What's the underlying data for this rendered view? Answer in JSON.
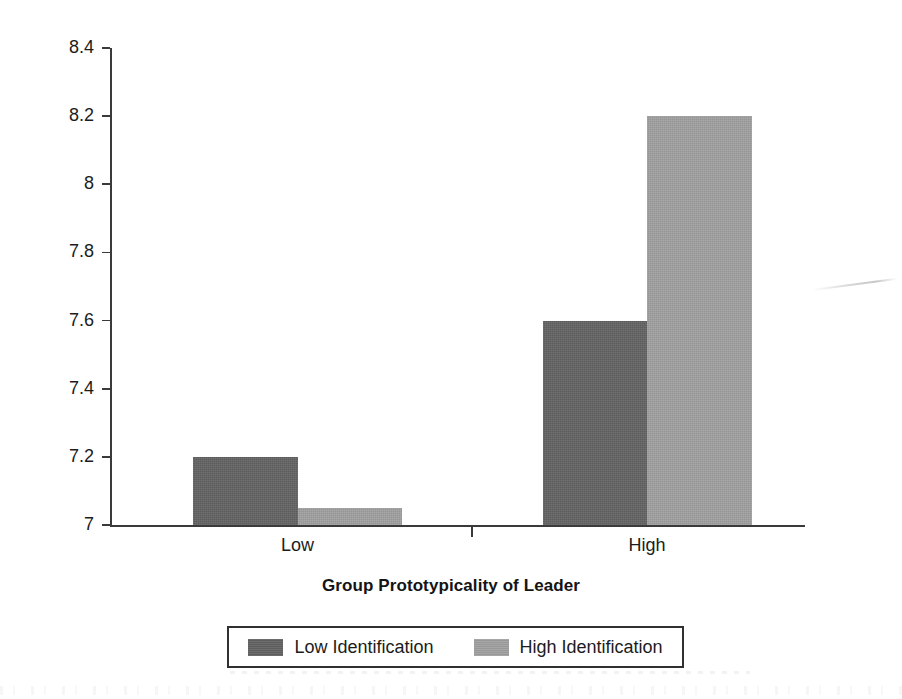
{
  "chart_data": {
    "type": "bar",
    "title": "",
    "xlabel": "Group Prototypicality of Leader",
    "ylabel": "Perceived Leadership Effectiveness",
    "categories": [
      "Low",
      "High"
    ],
    "series": [
      {
        "name": "Low Identification",
        "color": "#636363",
        "values": [
          7.2,
          7.6
        ]
      },
      {
        "name": "High Identification",
        "color": "#a0a0a0",
        "values": [
          7.05,
          8.2
        ]
      }
    ],
    "ylim": [
      7,
      8.4
    ],
    "ytick_values": [
      7,
      7.2,
      7.4,
      7.6,
      7.8,
      8,
      8.2,
      8.4
    ],
    "ytick_labels": [
      "7",
      "7.2",
      "7.4",
      "7.6",
      "7.8",
      "8",
      "8.2",
      "8.4"
    ],
    "grid": false,
    "legend_position": "bottom-center",
    "legend_entries": [
      "Low Identification",
      "High Identification"
    ]
  },
  "axes": {
    "y_title": "Perceived Leadership Effectiveness",
    "x_title": "Group Prototypicality of Leader",
    "y_ticks": [
      {
        "label": "8.4",
        "value": 8.4
      },
      {
        "label": "8.2",
        "value": 8.2
      },
      {
        "label": "8",
        "value": 8.0
      },
      {
        "label": "7.8",
        "value": 7.8
      },
      {
        "label": "7.6",
        "value": 7.6
      },
      {
        "label": "7.4",
        "value": 7.4
      },
      {
        "label": "7.2",
        "value": 7.2
      },
      {
        "label": "7",
        "value": 7.0
      }
    ],
    "x_ticks": [
      {
        "label": "Low"
      },
      {
        "label": "High"
      }
    ]
  },
  "legend": {
    "entries": [
      {
        "label": "Low Identification",
        "color": "#636363"
      },
      {
        "label": "High Identification",
        "color": "#a0a0a0"
      }
    ]
  },
  "colors": {
    "dark_bar": "#636363",
    "light_bar": "#a0a0a0",
    "axis": "#3a3a3a",
    "text": "#1c1c1c",
    "background": "#ffffff"
  }
}
